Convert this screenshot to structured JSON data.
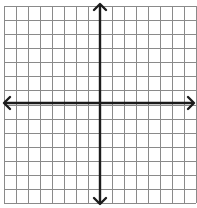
{
  "diagram": {
    "type": "coordinate-plane",
    "grid": {
      "columns": 16,
      "rows": 14,
      "left": 4,
      "top": 6,
      "right": 196,
      "bottom": 203,
      "color": "#8a8a8a"
    },
    "axes": {
      "x_axis_y": 103,
      "y_axis_x": 100,
      "color": "#1c1c1c",
      "arrows": [
        "left",
        "right",
        "up",
        "down"
      ]
    },
    "labels": []
  }
}
